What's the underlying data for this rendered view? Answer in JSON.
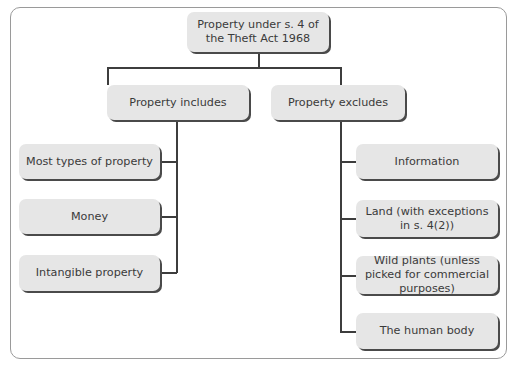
{
  "diagram": {
    "root": {
      "label": "Property under s. 4 of the Theft Act 1968"
    },
    "branches": [
      {
        "label": "Property includes",
        "items": [
          {
            "label": "Most types of property"
          },
          {
            "label": "Money"
          },
          {
            "label": "Intangible property"
          }
        ]
      },
      {
        "label": "Property excludes",
        "items": [
          {
            "label": "Information"
          },
          {
            "label": "Land (with exceptions in s. 4(2))"
          },
          {
            "label": "Wild plants (unless picked for commercial purposes)"
          },
          {
            "label": "The human body"
          }
        ]
      }
    ],
    "colors": {
      "box_fill": "#e6e6e6",
      "box_shadow": "#4a4a4a",
      "connector": "#3d3d3d",
      "frame_border": "#9a9a9a",
      "text": "#3a3a3a"
    }
  }
}
